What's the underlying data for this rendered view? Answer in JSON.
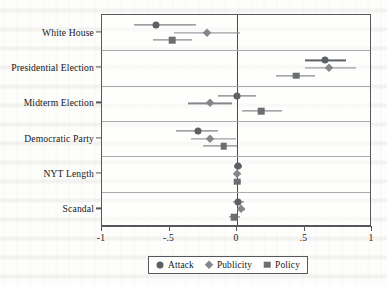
{
  "chart_data": {
    "type": "scatter",
    "title": "",
    "subtitle": "",
    "xlabel": "",
    "ylabel": "",
    "xlim": [
      -1,
      1
    ],
    "grid": true,
    "grid_axis": "y",
    "legend_position": "bottom",
    "zero_reference_line": 0,
    "xticks": [
      -1,
      -0.5,
      0,
      0.5,
      1
    ],
    "xticklabels": [
      "-1",
      "-.5",
      "0",
      ".5",
      "1"
    ],
    "categories": [
      "White House",
      "Presidential Election",
      "Midterm Election",
      "Democratic Party",
      "NYT Length",
      "Scandal"
    ],
    "series": [
      {
        "name": "Attack",
        "marker": "circle",
        "color": "#5d6064",
        "values": [
          -0.6,
          0.65,
          0.0,
          -0.29,
          0.01,
          0.01
        ],
        "ci_low": [
          -0.76,
          0.5,
          -0.14,
          -0.45,
          -0.02,
          -0.03
        ],
        "ci_high": [
          -0.3,
          0.81,
          0.14,
          -0.14,
          0.04,
          0.05
        ]
      },
      {
        "name": "Publicity",
        "marker": "diamond",
        "color": "#83868a",
        "values": [
          -0.22,
          0.68,
          -0.2,
          -0.2,
          0.0,
          0.03
        ],
        "ci_low": [
          -0.47,
          0.5,
          -0.36,
          -0.34,
          -0.02,
          0.0
        ],
        "ci_high": [
          0.02,
          0.88,
          -0.04,
          -0.01,
          0.03,
          0.06
        ]
      },
      {
        "name": "Policy",
        "marker": "square",
        "color": "#6b6e72",
        "values": [
          -0.48,
          0.44,
          0.18,
          -0.1,
          0.0,
          -0.02
        ],
        "ci_low": [
          -0.62,
          0.29,
          0.04,
          -0.25,
          -0.02,
          -0.06
        ],
        "ci_high": [
          -0.33,
          0.58,
          0.33,
          0.0,
          0.03,
          0.02
        ]
      }
    ]
  },
  "legend": {
    "items": [
      {
        "label": "Attack",
        "marker": "circle"
      },
      {
        "label": "Publicity",
        "marker": "diamond"
      },
      {
        "label": "Policy",
        "marker": "square"
      }
    ]
  }
}
